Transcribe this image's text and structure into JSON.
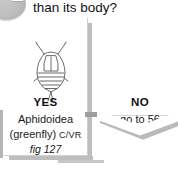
{
  "page": {
    "step_number": "22",
    "question": "than its body?"
  },
  "branches": {
    "yes": {
      "answer_label": "YES",
      "taxon": "Aphidoidea",
      "common_name": "(greenfly)",
      "code": "C/VR",
      "figure_ref": "fig 127",
      "illustration_name": "aphid-illustration"
    },
    "no": {
      "answer_label": "NO",
      "goto_text": "go to 56",
      "illustration_name": "elongate-insect-illustration"
    }
  },
  "colors": {
    "page_background": "#ffffff",
    "card_background": "#ffffff",
    "shadow": "#a8a8a8",
    "badge": "#bdbdbd",
    "text": "#1a1a1a",
    "line_art": "#5a5a5a"
  }
}
